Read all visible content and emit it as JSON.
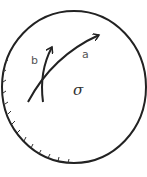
{
  "diagram": {
    "type": "physics-field-region",
    "boundary": {
      "shape": "circle",
      "stroke": "#222222",
      "hatched_side": "lower-left"
    },
    "center_symbol": "σ",
    "paths": [
      {
        "label": "a",
        "description": "long curved arrow sweeping upward to the right"
      },
      {
        "label": "b",
        "description": "short curved arrow pointing upward"
      }
    ],
    "colors": {
      "line": "#222222",
      "label": "#555555"
    }
  }
}
